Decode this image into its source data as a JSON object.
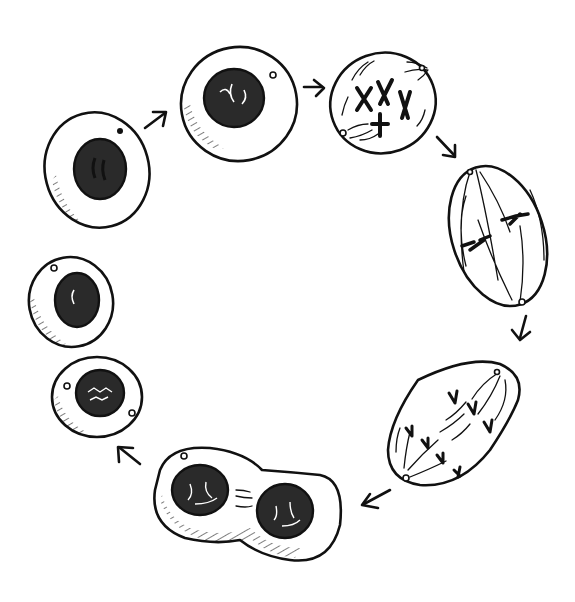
{
  "figure": {
    "style": "hand-drawn black ink illustration on white",
    "background": "#ffffff",
    "ink_color": "#111111",
    "cycle_direction": "clockwise"
  },
  "stages": [
    {
      "id": "interphase-1",
      "label": "Interphase (G1)",
      "shape": "round cell, dark hatched nucleus, one centrosome dot"
    },
    {
      "id": "prophase-early",
      "label": "Early prophase",
      "shape": "round cell, nucleus with condensing chromosomes"
    },
    {
      "id": "prophase-late",
      "label": "Prometaphase",
      "shape": "oval cell, four X-shaped chromosomes, spindle lines"
    },
    {
      "id": "metaphase",
      "label": "Metaphase",
      "shape": "tilted oval, chromosomes at equator, poles top/bottom"
    },
    {
      "id": "anaphase",
      "label": "Anaphase",
      "shape": "peanut-shaped cell, chromatids moving to poles"
    },
    {
      "id": "telophase",
      "label": "Telophase / Cytokinesis",
      "shape": "dumbbell cell with two hatched nuclei"
    },
    {
      "id": "daughter-1",
      "label": "Daughter cell",
      "shape": "round cell, hatched nucleus, two centrosomes"
    },
    {
      "id": "daughter-2",
      "label": "Daughter cell (G1)",
      "shape": "round cell, hatched nucleus, one centrosome"
    }
  ],
  "arrows": [
    {
      "from": "interphase-1",
      "to": "prophase-early"
    },
    {
      "from": "prophase-early",
      "to": "prophase-late"
    },
    {
      "from": "prophase-late",
      "to": "metaphase"
    },
    {
      "from": "metaphase",
      "to": "anaphase"
    },
    {
      "from": "anaphase",
      "to": "telophase"
    },
    {
      "from": "telophase",
      "to": "daughter-1"
    }
  ]
}
